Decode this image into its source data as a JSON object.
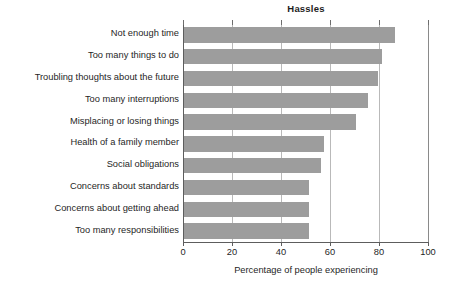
{
  "chart_data": {
    "type": "bar",
    "orientation": "horizontal",
    "title": "Hassles",
    "xlabel": "Percentage of people experiencing",
    "ylabel": "",
    "xlim": [
      0,
      100
    ],
    "xticks": [
      0,
      20,
      40,
      60,
      80,
      100
    ],
    "xtick_labels": [
      "0",
      "20",
      "40",
      "60",
      "80",
      "100"
    ],
    "grid": true,
    "legend": null,
    "bar_color": "#9d9d9d",
    "categories": [
      "Not enough time",
      "Too many things to do",
      "Troubling thoughts about the future",
      "Too many interruptions",
      "Misplacing or losing things",
      "Health of a family member",
      "Social obligations",
      "Concerns about standards",
      "Concerns about getting ahead",
      "Too many responsibilities"
    ],
    "values": [
      86,
      81,
      79,
      75,
      70,
      57,
      56,
      51,
      51,
      51
    ]
  }
}
